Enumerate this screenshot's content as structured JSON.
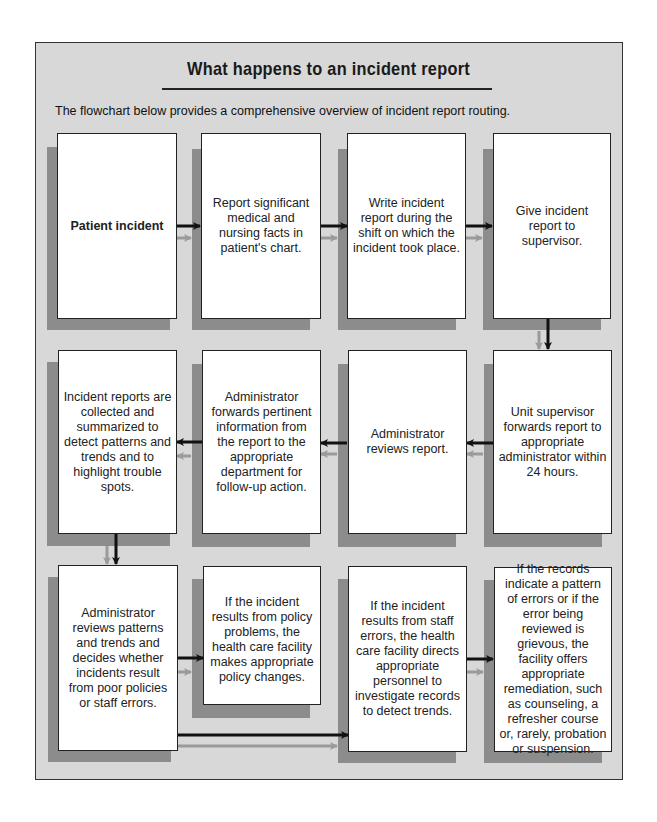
{
  "title": "What happens to an incident report",
  "intro": "The flowchart below provides a comprehensive overview of incident report routing.",
  "colors": {
    "background": "#d8d8d8",
    "shadow": "#8c8c8c",
    "box": "#ffffff",
    "arrow_primary": "#111111",
    "arrow_secondary": "#9a9a9a"
  },
  "steps": [
    {
      "id": 1,
      "text": "Patient incident"
    },
    {
      "id": 2,
      "text": "Report significant medical and nursing facts in patient's chart."
    },
    {
      "id": 3,
      "text": "Write incident report during the shift on which the incident took place."
    },
    {
      "id": 4,
      "text": "Give incident report to supervisor."
    },
    {
      "id": 5,
      "text": "Unit supervisor forwards report to appropriate administrator within 24 hours."
    },
    {
      "id": 6,
      "text": "Administrator reviews report."
    },
    {
      "id": 7,
      "text": "Administrator forwards pertinent information from the report to the appropriate department for follow-up action."
    },
    {
      "id": 8,
      "text": "Incident reports are collected and summarized to detect patterns and trends and to highlight trouble spots."
    },
    {
      "id": 9,
      "text": "Administrator reviews patterns and trends and decides whether incidents result from poor policies or staff errors."
    },
    {
      "id": 10,
      "text": "If the incident results from policy problems, the health care facility makes appropriate policy changes."
    },
    {
      "id": 11,
      "text": "If the incident results from staff errors, the health care facility directs appropriate personnel to investigate records to detect trends."
    },
    {
      "id": 12,
      "text": "If the records indicate a pattern of errors or if the error being reviewed is grievous, the facility offers appropriate remediation, such as counseling, a refresher course or, rarely, probation or suspension."
    }
  ],
  "flow": [
    {
      "from": 1,
      "to": 2
    },
    {
      "from": 2,
      "to": 3
    },
    {
      "from": 3,
      "to": 4
    },
    {
      "from": 4,
      "to": 5
    },
    {
      "from": 5,
      "to": 6
    },
    {
      "from": 6,
      "to": 7
    },
    {
      "from": 7,
      "to": 8
    },
    {
      "from": 8,
      "to": 9
    },
    {
      "from": 9,
      "to": 10
    },
    {
      "from": 9,
      "to": 11
    },
    {
      "from": 11,
      "to": 12
    }
  ]
}
